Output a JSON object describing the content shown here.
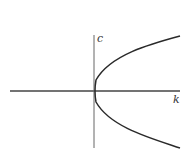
{
  "diagram": {
    "type": "parabola-on-axes",
    "axes": {
      "horizontal_label": "k",
      "vertical_label": "c"
    },
    "curve": {
      "description": "rightward-opening parabola with vertex at origin",
      "color": "#2a2a2a"
    },
    "colors": {
      "axis": "#555555",
      "curve": "#2a2a2a",
      "background": "#ffffff"
    }
  }
}
